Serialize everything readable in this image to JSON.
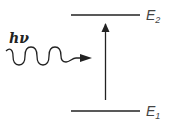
{
  "diagram": {
    "photon_label": "hv",
    "photon_label_display": "hν",
    "levels": [
      {
        "name": "E2",
        "base": "E",
        "subscript": "2",
        "position": "upper"
      },
      {
        "name": "E1",
        "base": "E",
        "subscript": "1",
        "position": "lower"
      }
    ],
    "transition": {
      "from": "E1",
      "to": "E2",
      "direction": "up"
    },
    "colors": {
      "line": "#222222",
      "label": "#444444"
    }
  }
}
